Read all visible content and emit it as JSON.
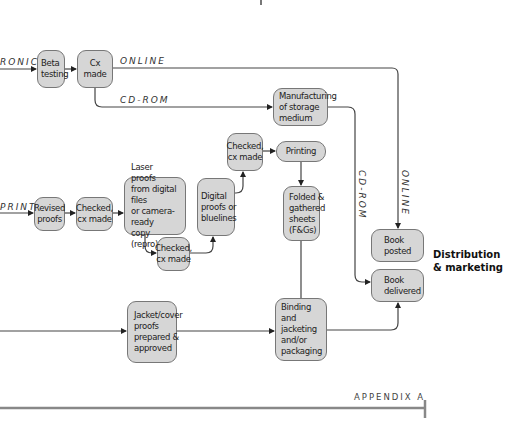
{
  "flows": {
    "electronic": "RONIC",
    "print": "PRINT",
    "online_h": "ONLINE",
    "cdrom_h": "CD-ROM",
    "cdrom_v": "CD-ROM",
    "online_v": "ONLINE"
  },
  "boxes": {
    "beta_testing": "Beta\ntesting",
    "cx_made": "Cx made",
    "manufacturing": "Manufacturing\nof storage\nmedium",
    "revised_proofs": "Revised\nproofs",
    "checked_1": "Checked,\ncx made",
    "laser_proofs": "Laser proofs\nfrom digital files\nor camera-ready\ncopy (repro)",
    "checked_2": "Checked,\ncx made",
    "digital_proofs": "Digital\nproofs or\nbluelines",
    "checked_3": "Checked,\ncx made",
    "printing": "Printing",
    "folded": "Folded &\ngathered\nsheets\n(F&Gs)",
    "jacket": "Jacket/cover\nproofs\nprepared &\napproved",
    "binding": "Binding and\njacketing\nand/or\npackaging",
    "book_posted": "Book\nposted",
    "book_delivered": "Book\ndelivered"
  },
  "section": {
    "distribution": "Distribution\n& marketing"
  },
  "footer": {
    "label": "APPENDIX A"
  },
  "colors": {
    "box_fill": "#d6d6d6",
    "line": "#444444"
  }
}
